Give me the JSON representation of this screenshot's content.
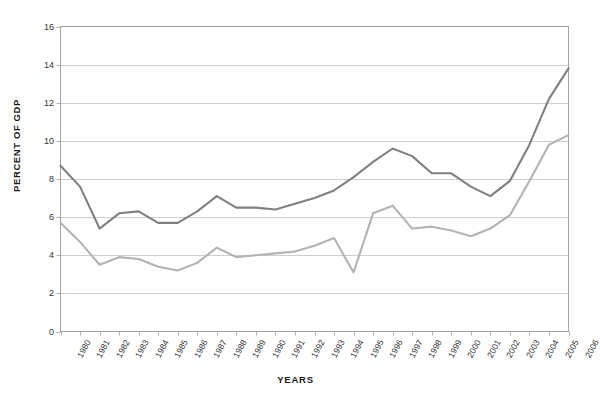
{
  "chart_data": {
    "type": "line",
    "title": "",
    "xlabel": "YEARS",
    "ylabel": "PERCENT OF GDP",
    "ylim": [
      0,
      16
    ],
    "ytick_step": 2,
    "yticks": [
      "16",
      "14",
      "12",
      "10",
      "8",
      "6",
      "4",
      "2",
      "0"
    ],
    "grid": true,
    "legend_position": "none",
    "categories": [
      "1980",
      "1981",
      "1982",
      "1983",
      "1984",
      "1985",
      "1986",
      "1987",
      "1988",
      "1989",
      "1990",
      "1991",
      "1992",
      "1993",
      "1994",
      "1995",
      "1996",
      "1997",
      "1998",
      "1999",
      "2000",
      "2001",
      "2002",
      "2003",
      "2004",
      "2005",
      "2006"
    ],
    "series": [
      {
        "name": "series-upper",
        "color": "#808080",
        "values": [
          8.7,
          7.6,
          5.4,
          6.2,
          6.3,
          5.7,
          5.7,
          6.3,
          7.1,
          6.5,
          6.5,
          6.4,
          6.7,
          7.0,
          7.4,
          8.1,
          8.9,
          9.6,
          9.2,
          8.3,
          8.3,
          7.6,
          7.1,
          7.9,
          9.8,
          12.2,
          13.8
        ]
      },
      {
        "name": "series-lower",
        "color": "#b3b3b3",
        "values": [
          5.7,
          4.7,
          3.5,
          3.9,
          3.8,
          3.4,
          3.2,
          3.6,
          4.4,
          3.9,
          4.0,
          4.1,
          4.2,
          4.5,
          4.9,
          3.1,
          6.2,
          6.6,
          5.4,
          5.5,
          5.3,
          5.0,
          5.4,
          6.1,
          7.9,
          9.8,
          10.3
        ]
      }
    ]
  }
}
